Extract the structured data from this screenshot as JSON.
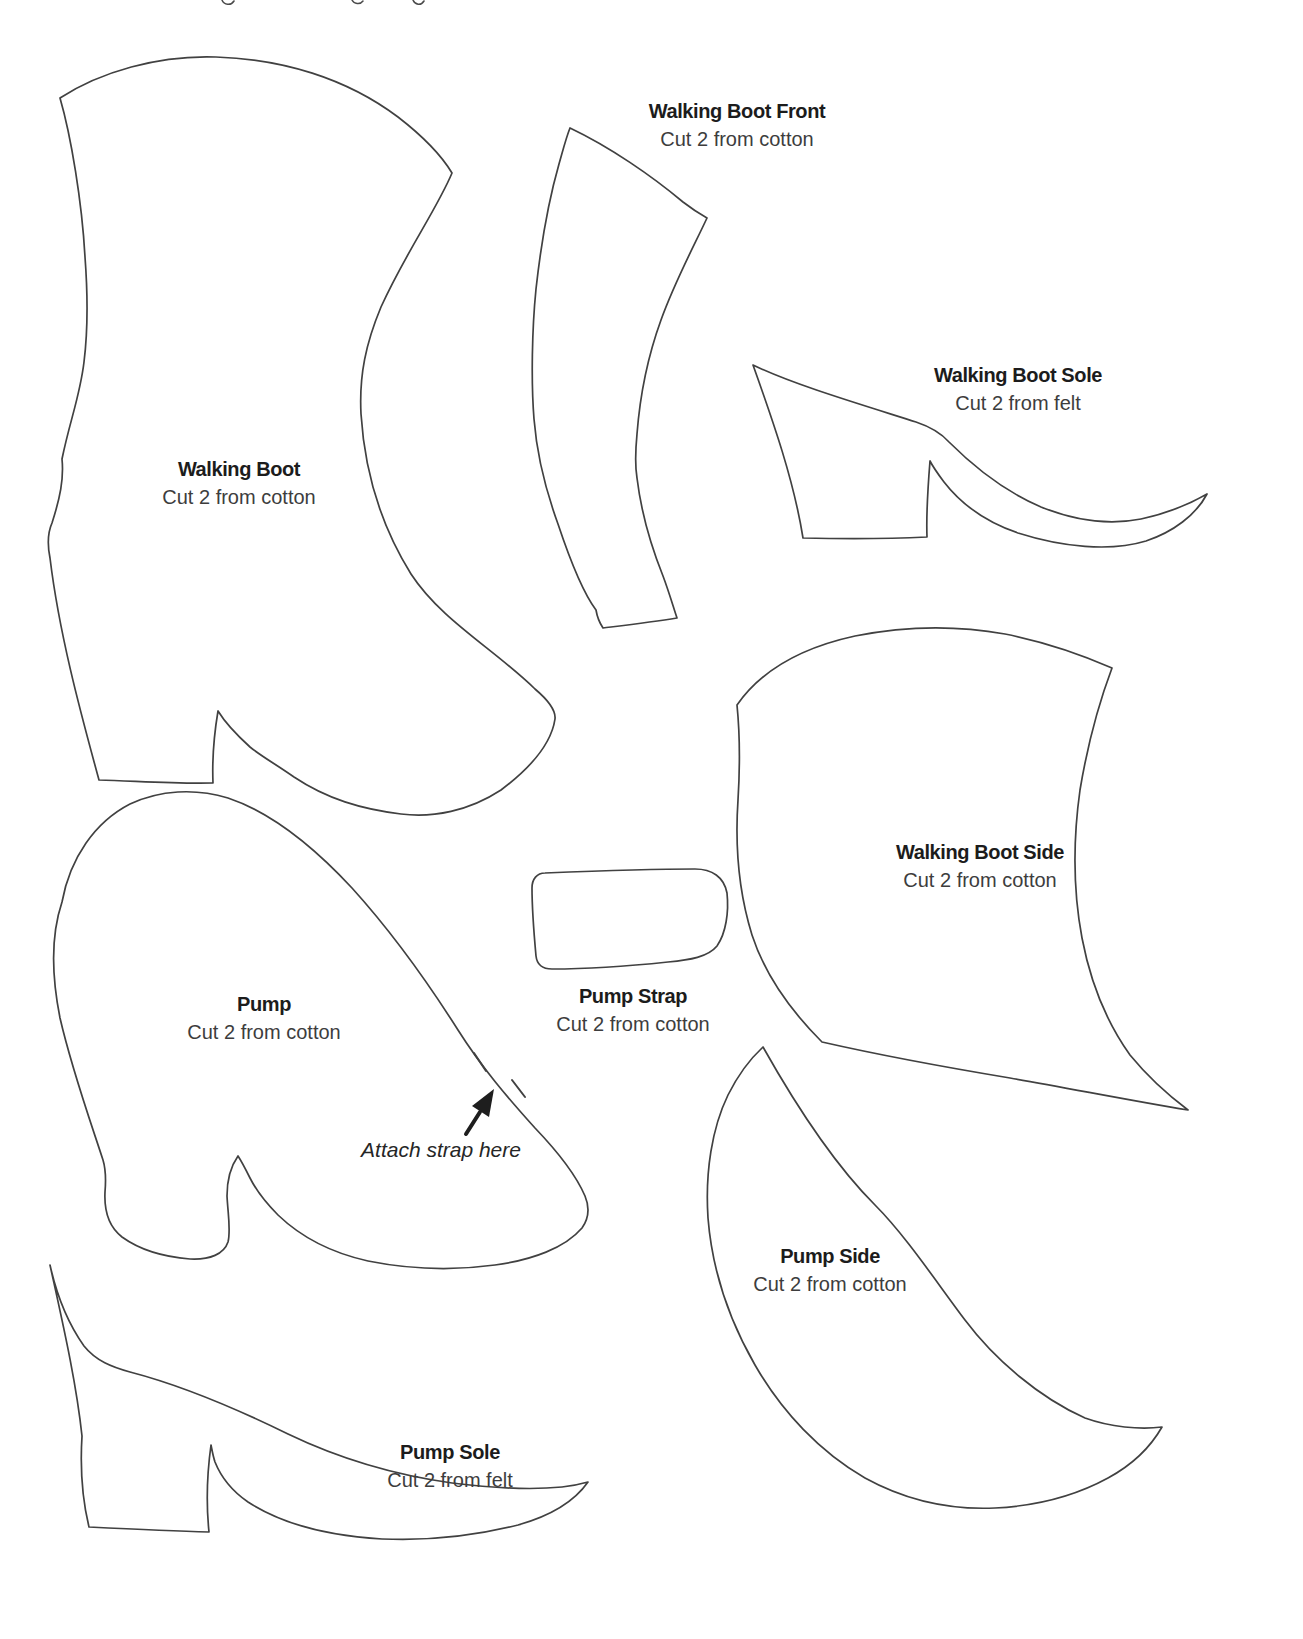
{
  "page": {
    "kind": "sewing pattern sheet",
    "colors": {
      "background": "#ffffff",
      "outline": "#414141",
      "title_text": "#1c1c1c",
      "subtitle_text": "#3d3d3d",
      "annotation_text": "#262626"
    }
  },
  "pieces": {
    "walking_boot": {
      "title": "Walking Boot",
      "subtitle": "Cut 2 from cotton"
    },
    "walking_boot_front": {
      "title": "Walking Boot Front",
      "subtitle": "Cut 2 from cotton"
    },
    "walking_boot_sole": {
      "title": "Walking Boot Sole",
      "subtitle": "Cut 2 from felt"
    },
    "walking_boot_side": {
      "title": "Walking Boot Side",
      "subtitle": "Cut 2 from cotton"
    },
    "pump": {
      "title": "Pump",
      "subtitle": "Cut 2 from cotton"
    },
    "pump_strap": {
      "title": "Pump Strap",
      "subtitle": "Cut 2 from cotton"
    },
    "pump_side": {
      "title": "Pump Side",
      "subtitle": "Cut 2 from cotton"
    },
    "pump_sole": {
      "title": "Pump Sole",
      "subtitle": "Cut 2 from felt"
    }
  },
  "annotations": {
    "attach_strap": "Attach strap here"
  }
}
